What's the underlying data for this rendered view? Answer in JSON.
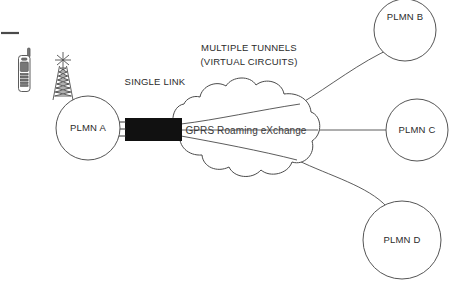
{
  "diagram": {
    "background_color": "#ffffff",
    "line_color": "#4a4a4a",
    "bar_color": "#111111",
    "text_color": "#2b2b2b"
  },
  "annotations": {
    "single_link": "SINGLE LINK",
    "multiple_tunnels_line1": "MULTIPLE TUNNELS",
    "multiple_tunnels_line2": "(VIRTUAL CIRCUITS)"
  },
  "cloud": {
    "label": "GPRS Roaming eXchange"
  },
  "nodes": [
    {
      "id": "plmn-a",
      "label": "PLMN A",
      "cx": 88,
      "cy": 128,
      "r": 32
    },
    {
      "id": "plmn-b",
      "label": "PLMN B",
      "cx": 405,
      "cy": 30,
      "r": 31
    },
    {
      "id": "plmn-c",
      "label": "PLMN C",
      "cx": 417,
      "cy": 130,
      "r": 31
    },
    {
      "id": "plmn-d",
      "label": "PLMN D",
      "cx": 402,
      "cy": 240,
      "r": 39
    }
  ],
  "icons": {
    "mobile_phone": "mobile-phone-icon",
    "cell_tower": "cell-tower-icon",
    "corner_mark": "corner-rule-mark"
  }
}
